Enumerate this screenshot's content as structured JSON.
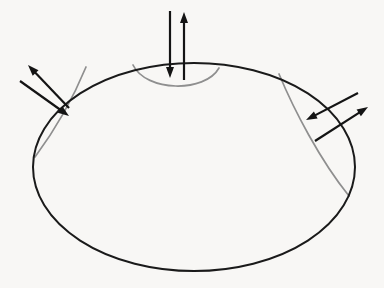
{
  "figure": {
    "background_color": "#f8f7f5",
    "width": 384,
    "height": 288
  },
  "style": {
    "boundary_color": "#1a1a1a",
    "boundary_width": 2.0,
    "arc_color": "#8f8f8f",
    "arc_width": 1.7,
    "vector_color": "#141414",
    "vector_width": 2.2
  },
  "chart_data": {
    "type": "diagram",
    "boundary": {
      "name": "outer-ellipse",
      "shape": "ellipse",
      "cx": 194,
      "cy": 167,
      "rx": 161,
      "ry": 104,
      "stroke": "#1a1a1a"
    },
    "arcs": [
      {
        "name": "top-cap-arc",
        "label": "top region boundary",
        "path": "M 133 65 C 146 92, 205 93, 219 68",
        "stroke": "#8f8f8f"
      },
      {
        "name": "left-cap-arc",
        "label": "left region boundary",
        "path": "M 86 67 C 72 101, 52 134, 35 157",
        "stroke": "#8f8f8f"
      },
      {
        "name": "right-cap-arc",
        "label": "right region boundary",
        "path": "M 279 74 C 294 110, 320 160, 349 196",
        "stroke": "#8f8f8f"
      }
    ],
    "vector_pairs": [
      {
        "name": "top-vector-pair",
        "location": "top",
        "vectors": [
          {
            "name": "top-inward-vector",
            "direction": "inward",
            "orientation": "down",
            "x1": 170,
            "y1": 11,
            "x2": 170,
            "y2": 78
          },
          {
            "name": "top-outward-vector",
            "direction": "outward",
            "orientation": "up",
            "x1": 184,
            "y1": 80,
            "x2": 184,
            "y2": 12
          }
        ]
      },
      {
        "name": "left-vector-pair",
        "location": "upper-left",
        "vectors": [
          {
            "name": "left-outward-vector",
            "direction": "outward",
            "orientation": "up-left",
            "x1": 69,
            "y1": 108,
            "x2": 28,
            "y2": 65
          },
          {
            "name": "left-inward-vector",
            "direction": "inward",
            "orientation": "down-right",
            "x1": 20,
            "y1": 81,
            "x2": 69,
            "y2": 116
          }
        ]
      },
      {
        "name": "right-vector-pair",
        "location": "upper-right",
        "vectors": [
          {
            "name": "right-outward-vector",
            "direction": "outward",
            "orientation": "up-right",
            "x1": 315,
            "y1": 141,
            "x2": 368,
            "y2": 107
          },
          {
            "name": "right-inward-vector",
            "direction": "inward",
            "orientation": "down-left",
            "x1": 358,
            "y1": 93,
            "x2": 306,
            "y2": 120
          }
        ]
      }
    ]
  }
}
